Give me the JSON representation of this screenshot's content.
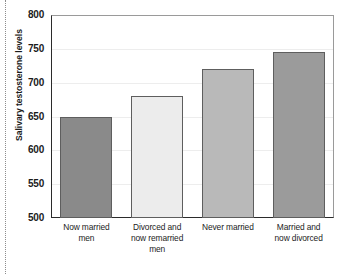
{
  "chart_data": {
    "type": "bar",
    "title": "",
    "xlabel": "",
    "ylabel": "Salivary testosterone levels",
    "categories": [
      "Now married men",
      "Divorced and now remarried men",
      "Never married",
      "Married and now divorced"
    ],
    "category_lines": [
      [
        "Now married",
        "men"
      ],
      [
        "Divorced and",
        "now remarried",
        "men"
      ],
      [
        "Never married"
      ],
      [
        "Married and",
        "now divorced"
      ]
    ],
    "values": [
      650,
      680,
      720,
      745
    ],
    "ylim": [
      500,
      800
    ],
    "yticks": [
      500,
      550,
      600,
      650,
      700,
      750,
      800
    ],
    "ytick_labels": [
      "500",
      "550",
      "600",
      "650",
      "700",
      "750",
      "800"
    ],
    "grid": true,
    "legend": "none",
    "bar_colors": [
      "#8a8a8a",
      "#ececec",
      "#b9b9b9",
      "#9b9b9b"
    ],
    "bar_edge_color": "#5e5e5e",
    "axis_color": "#2b2b2b",
    "grid_color": "#ededed",
    "background": "#ffffff"
  }
}
